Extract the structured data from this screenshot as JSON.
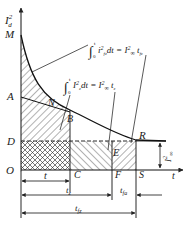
{
  "diagram": {
    "axes": {
      "y_label": "I²d",
      "x_label": "t",
      "origin": "O"
    },
    "points": {
      "M": "M",
      "A": "A",
      "N": "N",
      "B": "B",
      "D": "D",
      "E": "E",
      "R": "R",
      "C": "C",
      "F": "F",
      "S": "S"
    },
    "formulas": {
      "upper": "∫₀ᵗ i²fz dt = I²∞ tfz",
      "lower": "∫₀ᵗ I²z dt = I²∞ tz"
    },
    "dimensions": {
      "t": "t",
      "ts": "tz",
      "tfa": "tfa",
      "tfz": "tfz",
      "I_inf": "I²∞"
    }
  }
}
